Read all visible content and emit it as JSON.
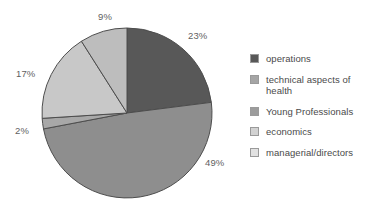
{
  "chart_data": {
    "type": "pie",
    "title": "",
    "categories": [
      "operations",
      "technical aspects of health",
      "Young Professionals",
      "economics",
      "managerial/directors"
    ],
    "values": [
      23,
      49,
      2,
      17,
      9
    ],
    "value_labels": [
      "23%",
      "49%",
      "2%",
      "17%",
      "9%"
    ],
    "colors": [
      "#585858",
      "#8e8e8e",
      "#a8a8a8",
      "#c8c8c8",
      "#bdbdbd"
    ],
    "legend_position": "right",
    "grid": false,
    "start_angle_deg": 0,
    "direction": "clockwise",
    "unit": "%"
  },
  "pie": {
    "center_x": 127,
    "center_y": 113,
    "radius": 85,
    "stroke_color": "#4d4d4d",
    "slices": [
      {
        "key": "operations",
        "percent": 23,
        "label": "23%",
        "color": "#585858",
        "label_x": 188,
        "label_y": 31
      },
      {
        "key": "technical aspects of health",
        "percent": 49,
        "label": "49%",
        "color": "#8e8e8e",
        "label_x": 205,
        "label_y": 158
      },
      {
        "key": "Young Professionals",
        "percent": 2,
        "label": "2%",
        "color": "#a8a8a8",
        "label_x": 15,
        "label_y": 126
      },
      {
        "key": "economics",
        "percent": 17,
        "label": "17%",
        "color": "#c8c8c8",
        "label_x": 16,
        "label_y": 69
      },
      {
        "key": "managerial/directors",
        "percent": 9,
        "label": "9%",
        "color": "#bdbdbd",
        "label_x": 98,
        "label_y": 12
      }
    ]
  },
  "legend": {
    "items": [
      {
        "label": "operations",
        "color": "#585858"
      },
      {
        "label": "technical aspects of health",
        "color": "#a5a5a5"
      },
      {
        "label": "Young Professionals",
        "color": "#9c9c9c"
      },
      {
        "label": "economics",
        "color": "#d2d2d2"
      },
      {
        "label": "managerial/directors",
        "color": "#e2e2e2"
      }
    ]
  }
}
